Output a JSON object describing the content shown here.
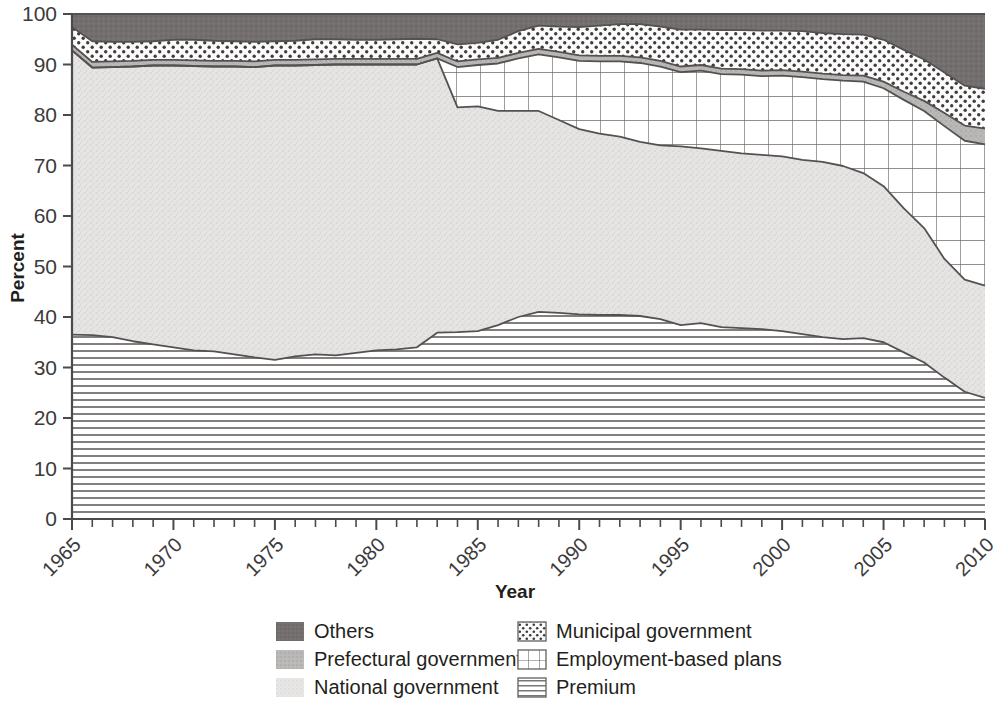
{
  "chart_data": {
    "type": "area",
    "title": "",
    "subtitle": "",
    "xlabel": "Year",
    "ylabel": "Percent",
    "xlim": [
      1965,
      2010
    ],
    "ylim": [
      0,
      100
    ],
    "grid": false,
    "legend_position": "bottom",
    "stacked": true,
    "stack_order_bottom_to_top": [
      "Premium",
      "National government",
      "Employment-based plans",
      "Prefectural government",
      "Municipal government",
      "Others"
    ],
    "y_ticks": [
      0,
      10,
      20,
      30,
      40,
      50,
      60,
      70,
      80,
      90,
      100
    ],
    "x_ticks_major": [
      1965,
      1970,
      1975,
      1980,
      1985,
      1990,
      1995,
      2000,
      2005,
      2010
    ],
    "x_tick_interval_minor": 1,
    "x": [
      1965,
      1966,
      1967,
      1968,
      1969,
      1970,
      1971,
      1972,
      1973,
      1974,
      1975,
      1976,
      1977,
      1978,
      1979,
      1980,
      1981,
      1982,
      1983,
      1984,
      1985,
      1986,
      1987,
      1988,
      1989,
      1990,
      1991,
      1992,
      1993,
      1994,
      1995,
      1996,
      1997,
      1998,
      1999,
      2000,
      2001,
      2002,
      2003,
      2004,
      2005,
      2006,
      2007,
      2008,
      2009,
      2010
    ],
    "series": [
      {
        "name": "Premium",
        "pattern": "horizontal-lines",
        "color": "#ffffff",
        "values": [
          36.5,
          36.4,
          36.0,
          35.2,
          34.6,
          34.0,
          33.4,
          33.2,
          32.6,
          32.0,
          31.5,
          32.2,
          32.6,
          32.4,
          32.9,
          33.4,
          33.6,
          34.0,
          36.9,
          37.0,
          37.2,
          38.4,
          40.0,
          41.0,
          40.8,
          40.5,
          40.4,
          40.4,
          40.2,
          39.6,
          38.4,
          38.8,
          38.0,
          37.8,
          37.6,
          37.2,
          36.6,
          36.0,
          35.6,
          35.8,
          35.0,
          33.0,
          31.0,
          28.0,
          25.2,
          24.0
        ]
      },
      {
        "name": "National government",
        "pattern": "light-stipple",
        "color": "#e2e2e2",
        "values": [
          56.3,
          53.0,
          53.5,
          54.4,
          55.2,
          55.8,
          56.3,
          56.4,
          57.0,
          57.5,
          58.3,
          57.6,
          57.3,
          57.6,
          57.1,
          56.6,
          56.4,
          56.0,
          54.3,
          44.5,
          44.5,
          42.4,
          40.8,
          39.8,
          38.2,
          36.7,
          35.9,
          35.3,
          34.5,
          34.4,
          35.4,
          34.6,
          34.9,
          34.6,
          34.5,
          34.6,
          34.5,
          34.7,
          34.3,
          32.7,
          30.9,
          28.5,
          26.6,
          23.5,
          22.2,
          22.2
        ]
      },
      {
        "name": "Employment-based plans",
        "pattern": "grid-crosshatch",
        "color": "#ffffff",
        "values": [
          0,
          0,
          0,
          0,
          0,
          0,
          0,
          0,
          0,
          0,
          0,
          0,
          0,
          0,
          0,
          0,
          0,
          0,
          0,
          8.0,
          8.2,
          9.4,
          10.4,
          11.2,
          12.4,
          13.5,
          14.3,
          14.9,
          15.6,
          15.6,
          14.7,
          15.4,
          15.2,
          15.6,
          15.6,
          16.0,
          16.4,
          16.4,
          16.9,
          18.1,
          19.4,
          21.5,
          23.2,
          26.3,
          27.5,
          28.0
        ]
      },
      {
        "name": "Prefectural government",
        "pattern": "medium-gray",
        "color": "#b5b3b2",
        "values": [
          1.1,
          1.1,
          1.1,
          1.1,
          1.1,
          1.1,
          1.1,
          1.1,
          1.1,
          1.1,
          1.1,
          1.1,
          1.1,
          1.1,
          1.1,
          1.1,
          1.1,
          1.1,
          1.1,
          1.1,
          1.1,
          1.1,
          1.1,
          1.1,
          1.1,
          1.1,
          1.1,
          1.1,
          1.1,
          1.1,
          1.1,
          1.1,
          1.1,
          1.1,
          1.1,
          1.1,
          1.1,
          1.1,
          1.1,
          1.2,
          1.3,
          1.6,
          2.0,
          2.6,
          3.0,
          3.1
        ]
      },
      {
        "name": "Municipal government",
        "pattern": "dotted",
        "color": "#f6f6f6",
        "values": [
          3.5,
          4.1,
          3.9,
          3.8,
          3.7,
          4.0,
          4.1,
          4.0,
          3.9,
          3.9,
          3.7,
          3.8,
          4.0,
          3.9,
          3.8,
          3.8,
          3.9,
          4.0,
          2.7,
          3.4,
          3.3,
          3.6,
          4.3,
          4.6,
          5.0,
          5.6,
          6.0,
          6.3,
          6.6,
          6.8,
          7.3,
          7.0,
          7.6,
          7.7,
          7.9,
          7.8,
          8.0,
          8.0,
          8.1,
          8.1,
          8.3,
          8.3,
          8.2,
          8.0,
          7.9,
          7.9
        ]
      },
      {
        "name": "Others",
        "pattern": "dark-gray",
        "color": "#6e6c6b",
        "values": [
          2.6,
          5.4,
          5.5,
          5.5,
          5.4,
          5.1,
          5.1,
          5.3,
          5.4,
          5.5,
          5.4,
          5.3,
          5.0,
          5.0,
          5.1,
          5.1,
          5.0,
          4.9,
          5.0,
          6.0,
          5.7,
          5.1,
          3.4,
          2.3,
          2.5,
          2.6,
          2.3,
          2.0,
          2.0,
          2.5,
          3.1,
          3.1,
          3.2,
          3.2,
          3.3,
          3.3,
          3.4,
          3.8,
          4.0,
          4.1,
          5.1,
          7.1,
          9.0,
          11.6,
          14.2,
          14.8
        ]
      }
    ],
    "legend": [
      {
        "label": "Others",
        "pattern": "dark-gray"
      },
      {
        "label": "Municipal government",
        "pattern": "dotted"
      },
      {
        "label": "Prefectural government",
        "pattern": "medium-gray"
      },
      {
        "label": "Employment-based plans",
        "pattern": "grid-crosshatch"
      },
      {
        "label": "National government",
        "pattern": "light-stipple"
      },
      {
        "label": "Premium",
        "pattern": "horizontal-lines"
      }
    ]
  },
  "axes": {
    "y_title": "Percent",
    "x_title": "Year",
    "y_tick_labels": [
      "0",
      "10",
      "20",
      "30",
      "40",
      "50",
      "60",
      "70",
      "80",
      "90",
      "100"
    ],
    "x_tick_labels": [
      "1965",
      "1970",
      "1975",
      "1980",
      "1985",
      "1990",
      "1995",
      "2000",
      "2005",
      "2010"
    ]
  },
  "legend_items": {
    "col1": [
      "Others",
      "Prefectural government",
      "National government"
    ],
    "col2": [
      "Municipal government",
      "Employment-based plans",
      "Premium"
    ]
  },
  "colors": {
    "others": "#6e6c6b",
    "prefectural": "#b5b3b2",
    "national": "#e2e2e2",
    "municipal": "#f6f6f6",
    "employment": "#ffffff",
    "premium": "#ffffff",
    "axis": "#4a4a4a",
    "text": "#231f20"
  }
}
